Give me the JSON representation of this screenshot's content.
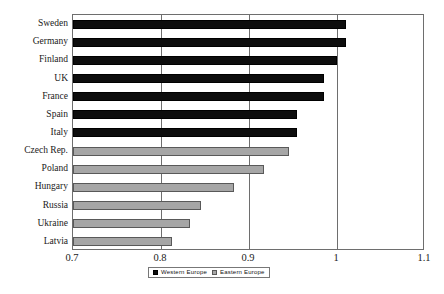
{
  "chart_data": {
    "type": "bar",
    "orientation": "horizontal",
    "title": "",
    "xlabel": "",
    "ylabel": "",
    "xlim": [
      0.7,
      1.1
    ],
    "xticks": [
      0.7,
      0.8,
      0.9,
      1.0,
      1.1
    ],
    "xtick_labels": [
      "0.7",
      "0.8",
      "0.9",
      "1",
      "1.1"
    ],
    "grid": true,
    "grid_axis": "x",
    "legend_position": "bottom",
    "categories": [
      "Sweden",
      "Germany",
      "Finland",
      "UK",
      "France",
      "Spain",
      "Italy",
      "Czech Rep.",
      "Poland",
      "Hungary",
      "Russia",
      "Ukraine",
      "Latvia"
    ],
    "values": [
      1.01,
      1.01,
      1.0,
      0.985,
      0.985,
      0.955,
      0.955,
      0.945,
      0.917,
      0.883,
      0.845,
      0.833,
      0.812
    ],
    "groups": [
      "Western Europe",
      "Western Europe",
      "Western Europe",
      "Western Europe",
      "Western Europe",
      "Western Europe",
      "Western Europe",
      "Eastern Europe",
      "Eastern Europe",
      "Eastern Europe",
      "Eastern Europe",
      "Eastern Europe",
      "Eastern Europe"
    ],
    "series": [
      {
        "name": "Western Europe",
        "color": "#0d0d0d",
        "points": [
          {
            "category": "Sweden",
            "value": 1.01
          },
          {
            "category": "Germany",
            "value": 1.01
          },
          {
            "category": "Finland",
            "value": 1.0
          },
          {
            "category": "UK",
            "value": 0.985
          },
          {
            "category": "France",
            "value": 0.985
          },
          {
            "category": "Spain",
            "value": 0.955
          },
          {
            "category": "Italy",
            "value": 0.955
          }
        ]
      },
      {
        "name": "Eastern Europe",
        "color": "#a6a6a6",
        "points": [
          {
            "category": "Czech Rep.",
            "value": 0.945
          },
          {
            "category": "Poland",
            "value": 0.917
          },
          {
            "category": "Hungary",
            "value": 0.883
          },
          {
            "category": "Russia",
            "value": 0.845
          },
          {
            "category": "Ukraine",
            "value": 0.833
          },
          {
            "category": "Latvia",
            "value": 0.812
          }
        ]
      }
    ]
  },
  "legend": {
    "items": [
      {
        "label": "Western Europe",
        "color": "#0d0d0d"
      },
      {
        "label": "Eastern Europe",
        "color": "#a6a6a6"
      }
    ]
  },
  "colors": {
    "western": "#0d0d0d",
    "eastern": "#a6a6a6",
    "axis": "#6e6e6e",
    "background": "#ffffff"
  }
}
